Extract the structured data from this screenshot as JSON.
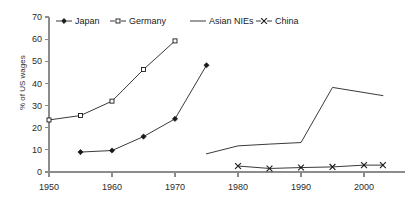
{
  "chart_data": {
    "type": "line",
    "title": "",
    "xlabel": "",
    "ylabel": "% of US wages",
    "xlim": [
      1950,
      2004
    ],
    "ylim": [
      0,
      70
    ],
    "grid": false,
    "legend_position": "top",
    "x_ticks": [
      "1950",
      "1960",
      "1970",
      "1980",
      "1990",
      "2000"
    ],
    "x_tick_values": [
      1950,
      1960,
      1970,
      1980,
      1990,
      2000
    ],
    "y_ticks": [
      "0",
      "10",
      "20",
      "30",
      "40",
      "50",
      "60",
      "70"
    ],
    "y_tick_values": [
      0,
      10,
      20,
      30,
      40,
      50,
      60,
      70
    ],
    "series": [
      {
        "name": "Japan",
        "marker": "filled-diamond",
        "x": [
          1955,
          1960,
          1965,
          1970,
          1975
        ],
        "values": [
          9.0,
          9.7,
          16.0,
          24.0,
          48.2
        ]
      },
      {
        "name": "Germany",
        "marker": "open-square",
        "x": [
          1950,
          1955,
          1960,
          1965,
          1970
        ],
        "values": [
          23.5,
          25.5,
          32.0,
          46.3,
          59.2
        ]
      },
      {
        "name": "Asian NIEs",
        "marker": "none",
        "x": [
          1975,
          1980,
          1985,
          1990,
          1995,
          2003
        ],
        "values": [
          8.2,
          11.8,
          12.6,
          13.3,
          38.2,
          34.5
        ]
      },
      {
        "name": "China",
        "marker": "cross",
        "x": [
          1980,
          1985,
          1990,
          1995,
          2000,
          2003
        ],
        "values": [
          2.7,
          1.6,
          2.0,
          2.3,
          3.1,
          3.1
        ]
      }
    ]
  },
  "legend": {
    "items": [
      {
        "label": "Japan",
        "marker": "filled-diamond"
      },
      {
        "label": "Germany",
        "marker": "open-square"
      },
      {
        "label": "Asian NIEs",
        "marker": "none"
      },
      {
        "label": "China",
        "marker": "cross"
      }
    ]
  }
}
